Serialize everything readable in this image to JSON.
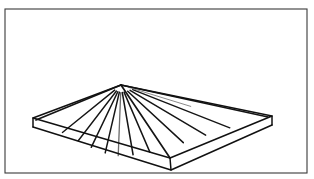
{
  "figure": {
    "style": "line-drawing",
    "background_color": "#ffffff",
    "ink_color": "#111111",
    "frame_color": "#3a3a3a",
    "canvas": {
      "width": 314,
      "height": 179
    }
  },
  "frame": {
    "name": "border-rectangle",
    "x": 5,
    "y": 9,
    "width": 302,
    "height": 164,
    "stroke_width": 1.1
  },
  "geometry": {
    "apex": {
      "x": 121,
      "y": 85
    },
    "slab_top_face": {
      "left_corner": {
        "x": 33,
        "y": 118
      },
      "back_corner": {
        "x": 121,
        "y": 85
      },
      "right_corner": {
        "x": 272,
        "y": 116
      },
      "front_corner": {
        "x": 170,
        "y": 158
      }
    },
    "slab_thickness": 9,
    "slab_bottom_face": {
      "left_corner": {
        "x": 33,
        "y": 127
      },
      "right_corner": {
        "x": 272,
        "y": 125
      },
      "front_corner": {
        "x": 171,
        "y": 170
      }
    },
    "eave_back_left": {
      "x": 33,
      "y": 118
    },
    "eave_back_right": {
      "x": 272,
      "y": 116
    },
    "rays": [
      {
        "id": "ray-1",
        "x2": 36,
        "y2": 120,
        "weight": 1.7,
        "tone": "dark",
        "full": true
      },
      {
        "id": "ray-2",
        "x2": 58,
        "y2": 136,
        "weight": 1.4,
        "tone": "dark",
        "full": false
      },
      {
        "id": "ray-3",
        "x2": 75,
        "y2": 145,
        "weight": 1.4,
        "tone": "dark",
        "full": false
      },
      {
        "id": "ray-4",
        "x2": 89,
        "y2": 152,
        "weight": 1.5,
        "tone": "dark",
        "full": false
      },
      {
        "id": "ray-5",
        "x2": 104,
        "y2": 158,
        "weight": 1.5,
        "tone": "dark",
        "full": false
      },
      {
        "id": "ray-6",
        "x2": 118,
        "y2": 161,
        "weight": 1.3,
        "tone": "light",
        "full": false
      },
      {
        "id": "ray-7",
        "x2": 134,
        "y2": 160,
        "weight": 1.5,
        "tone": "dark",
        "full": false
      },
      {
        "id": "ray-8",
        "x2": 152,
        "y2": 157,
        "weight": 1.6,
        "tone": "dark",
        "full": false
      },
      {
        "id": "ray-9",
        "x2": 170,
        "y2": 158,
        "weight": 1.7,
        "tone": "dark",
        "full": true
      },
      {
        "id": "ray-10",
        "x2": 188,
        "y2": 147,
        "weight": 1.5,
        "tone": "dark",
        "full": false
      },
      {
        "id": "ray-11",
        "x2": 212,
        "y2": 139,
        "weight": 1.5,
        "tone": "dark",
        "full": false
      },
      {
        "id": "ray-12",
        "x2": 238,
        "y2": 131,
        "weight": 1.4,
        "tone": "dark",
        "full": false
      },
      {
        "id": "ray-13",
        "x2": 268,
        "y2": 117,
        "weight": 1.7,
        "tone": "dark",
        "full": true
      },
      {
        "id": "ray-14",
        "x2": 196,
        "y2": 108,
        "weight": 0.8,
        "tone": "light",
        "full": false
      }
    ]
  },
  "labels": {
    "figure_caption": "",
    "alt_text": "Line drawing of a four-sided pyramidal roof over a square base slab drawn in perspective."
  }
}
